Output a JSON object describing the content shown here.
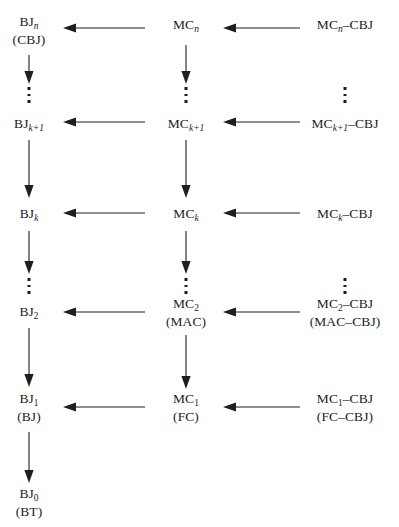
{
  "diagram": {
    "type": "hierarchy-flow",
    "title": "",
    "colors": {
      "background": "#ffffff",
      "text": "#1c1c1c",
      "arrow": "#1f1f1f"
    },
    "columns": [
      {
        "id": "bj",
        "name": "BJ column",
        "center_x": 29
      },
      {
        "id": "mc",
        "name": "MC column",
        "center_x": 186
      },
      {
        "id": "mccbj",
        "name": "MC-CBJ column",
        "center_x": 345
      }
    ],
    "rows": [
      {
        "id": "n",
        "index": "n",
        "center_y": 31
      },
      {
        "id": "k1",
        "index": "k+1",
        "center_y": 125
      },
      {
        "id": "k",
        "index": "k",
        "center_y": 215
      },
      {
        "id": "two",
        "index": "2",
        "center_y": 313
      },
      {
        "id": "one",
        "index": "1",
        "center_y": 408
      },
      {
        "id": "zero",
        "index": "0",
        "center_y": 503
      }
    ],
    "nodes": {
      "bj_n": {
        "line1_main": "BJ",
        "line1_sub": "n",
        "line2": "(CBJ)"
      },
      "bj_k1": {
        "line1_main": "BJ",
        "line1_sub": "k+1",
        "line2": ""
      },
      "bj_k": {
        "line1_main": "BJ",
        "line1_sub": "k",
        "line2": ""
      },
      "bj_2": {
        "line1_main": "BJ",
        "line1_sub": "2",
        "line2": ""
      },
      "bj_1": {
        "line1_main": "BJ",
        "line1_sub": "1",
        "line2": "(BJ)"
      },
      "bj_0": {
        "line1_main": "BJ",
        "line1_sub": "0",
        "line2": "(BT)"
      },
      "mc_n": {
        "line1_main": "MC",
        "line1_sub": "n",
        "line2": ""
      },
      "mc_k1": {
        "line1_main": "MC",
        "line1_sub": "k+1",
        "line2": ""
      },
      "mc_k": {
        "line1_main": "MC",
        "line1_sub": "k",
        "line2": ""
      },
      "mc_2": {
        "line1_main": "MC",
        "line1_sub": "2",
        "line2": "(MAC)"
      },
      "mc_1": {
        "line1_main": "MC",
        "line1_sub": "1",
        "line2": "(FC)"
      },
      "cbj_n": {
        "line1_main": "MC",
        "line1_sub": "n",
        "line1_tail": "–CBJ",
        "line2": ""
      },
      "cbj_k1": {
        "line1_main": "MC",
        "line1_sub": "k+1",
        "line1_tail": "–CBJ",
        "line2": ""
      },
      "cbj_k": {
        "line1_main": "MC",
        "line1_sub": "k",
        "line1_tail": "–CBJ",
        "line2": ""
      },
      "cbj_2": {
        "line1_main": "MC",
        "line1_sub": "2",
        "line1_tail": "–CBJ",
        "line2": "(MAC–CBJ)"
      },
      "cbj_1": {
        "line1_main": "MC",
        "line1_sub": "1",
        "line1_tail": "–CBJ",
        "line2": "(FC–CBJ)"
      }
    },
    "ellipses": [
      {
        "name": "bj-ellipsis-upper",
        "column": "bj",
        "center_x": 29,
        "center_y": 95
      },
      {
        "name": "bj-ellipsis-lower",
        "column": "bj",
        "center_x": 29,
        "center_y": 286
      },
      {
        "name": "mc-ellipsis-upper",
        "column": "mc",
        "center_x": 186,
        "center_y": 95
      },
      {
        "name": "mc-ellipsis-lower",
        "column": "mc",
        "center_x": 186,
        "center_y": 286
      },
      {
        "name": "mccbj-ellipsis-upper",
        "column": "mccbj",
        "center_x": 345,
        "center_y": 95
      },
      {
        "name": "mccbj-ellipsis-lower",
        "column": "mccbj",
        "center_x": 345,
        "center_y": 286
      }
    ],
    "horizontal_arrows": [
      {
        "name": "arrow-mcn-to-bjn",
        "row": "n",
        "from_x": 145,
        "to_x": 65,
        "y": 28,
        "direction": "left"
      },
      {
        "name": "arrow-cbjn-to-mcn",
        "row": "n",
        "from_x": 300,
        "to_x": 225,
        "y": 28,
        "direction": "left"
      },
      {
        "name": "arrow-mck1-to-bjk1",
        "row": "k+1",
        "from_x": 145,
        "to_x": 65,
        "y": 122,
        "direction": "left"
      },
      {
        "name": "arrow-cbjk1-to-mck1",
        "row": "k+1",
        "from_x": 300,
        "to_x": 225,
        "y": 122,
        "direction": "left"
      },
      {
        "name": "arrow-mck-to-bjk",
        "row": "k",
        "from_x": 145,
        "to_x": 65,
        "y": 213,
        "direction": "left"
      },
      {
        "name": "arrow-cbjk-to-mck",
        "row": "k",
        "from_x": 300,
        "to_x": 225,
        "y": 213,
        "direction": "left"
      },
      {
        "name": "arrow-mc2-to-bj2",
        "row": "2",
        "from_x": 145,
        "to_x": 65,
        "y": 312,
        "direction": "left"
      },
      {
        "name": "arrow-cbj2-to-mc2",
        "row": "2",
        "from_x": 300,
        "to_x": 225,
        "y": 312,
        "direction": "left"
      },
      {
        "name": "arrow-mc1-to-bj1",
        "row": "1",
        "from_x": 145,
        "to_x": 65,
        "y": 407,
        "direction": "left"
      },
      {
        "name": "arrow-cbj1-to-mc1",
        "row": "1",
        "from_x": 300,
        "to_x": 225,
        "y": 407,
        "direction": "left"
      }
    ],
    "vertical_arrows": [
      {
        "name": "arrow-bjn-down",
        "x": 29,
        "from_y": 55,
        "to_y": 83,
        "direction": "down"
      },
      {
        "name": "arrow-bjk1-down",
        "x": 29,
        "from_y": 107,
        "to_y": 148,
        "direction": "down"
      },
      {
        "name": "arrow-bjk1-to-bjk",
        "x": 29,
        "from_y": 148,
        "to_y": 196,
        "direction": "down"
      },
      {
        "name": "arrow-bjk-down",
        "x": 29,
        "from_y": 245,
        "to_y": 273,
        "direction": "down"
      },
      {
        "name": "arrow-bj2-down",
        "x": 29,
        "from_y": 330,
        "to_y": 386,
        "direction": "down"
      },
      {
        "name": "arrow-bj1-down",
        "x": 29,
        "from_y": 432,
        "to_y": 484,
        "direction": "down"
      },
      {
        "name": "arrow-mcn-down",
        "x": 186,
        "from_y": 47,
        "to_y": 83,
        "direction": "down"
      },
      {
        "name": "arrow-mck1-to-mck",
        "x": 186,
        "from_y": 140,
        "to_y": 196,
        "direction": "down"
      },
      {
        "name": "arrow-mck-down",
        "x": 186,
        "from_y": 233,
        "to_y": 273,
        "direction": "down"
      },
      {
        "name": "arrow-mc2-to-mc1",
        "x": 186,
        "from_y": 335,
        "to_y": 388,
        "direction": "down"
      }
    ]
  }
}
